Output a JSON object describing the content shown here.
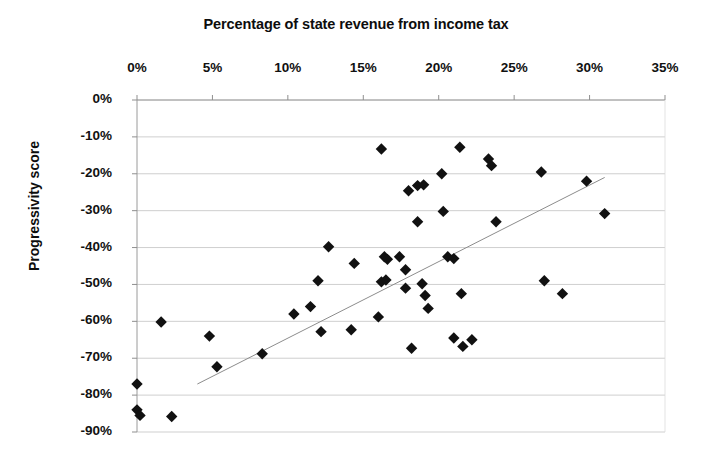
{
  "chart_data": {
    "type": "scatter",
    "title": "Percentage of state revenue from income tax",
    "xlabel": "Percentage of state revenue from income tax",
    "ylabel": "Progressivity score",
    "xlim": [
      0,
      35
    ],
    "ylim": [
      -90,
      0
    ],
    "grid": true,
    "legend": null,
    "x_axis_position": "top",
    "xticks": [
      "0%",
      "5%",
      "10%",
      "15%",
      "20%",
      "25%",
      "30%",
      "35%"
    ],
    "xtick_values": [
      0,
      5,
      10,
      15,
      20,
      25,
      30,
      35
    ],
    "yticks": [
      "0%",
      "-10%",
      "-20%",
      "-30%",
      "-40%",
      "-50%",
      "-60%",
      "-70%",
      "-80%",
      "-90%"
    ],
    "ytick_values": [
      0,
      -10,
      -20,
      -30,
      -40,
      -50,
      -60,
      -70,
      -80,
      -90
    ],
    "marker": "diamond",
    "marker_color": "#111111",
    "marker_size": 9,
    "trendline": {
      "x": [
        4.0,
        31.0
      ],
      "y": [
        -77.0,
        -21.0
      ],
      "color": "#8c8c8c",
      "width": 1
    },
    "points": [
      {
        "x": 0.0,
        "y": -77.0
      },
      {
        "x": 0.0,
        "y": -84.0
      },
      {
        "x": 0.2,
        "y": -85.5
      },
      {
        "x": 1.6,
        "y": -60.2
      },
      {
        "x": 2.3,
        "y": -85.8
      },
      {
        "x": 4.8,
        "y": -64.0
      },
      {
        "x": 5.3,
        "y": -72.3
      },
      {
        "x": 8.3,
        "y": -68.8
      },
      {
        "x": 10.4,
        "y": -58.0
      },
      {
        "x": 11.5,
        "y": -56.0
      },
      {
        "x": 12.0,
        "y": -49.0
      },
      {
        "x": 12.2,
        "y": -62.8
      },
      {
        "x": 12.7,
        "y": -39.8
      },
      {
        "x": 14.2,
        "y": -62.3
      },
      {
        "x": 14.4,
        "y": -44.3
      },
      {
        "x": 16.2,
        "y": -13.3
      },
      {
        "x": 16.4,
        "y": -42.5
      },
      {
        "x": 16.6,
        "y": -43.2
      },
      {
        "x": 16.2,
        "y": -49.3
      },
      {
        "x": 16.5,
        "y": -48.8
      },
      {
        "x": 16.0,
        "y": -58.8
      },
      {
        "x": 17.4,
        "y": -42.5
      },
      {
        "x": 17.8,
        "y": -46.0
      },
      {
        "x": 17.8,
        "y": -51.0
      },
      {
        "x": 18.0,
        "y": -24.6
      },
      {
        "x": 18.2,
        "y": -67.3
      },
      {
        "x": 18.6,
        "y": -23.2
      },
      {
        "x": 19.0,
        "y": -23.0
      },
      {
        "x": 18.6,
        "y": -33.0
      },
      {
        "x": 18.9,
        "y": -49.8
      },
      {
        "x": 19.1,
        "y": -53.0
      },
      {
        "x": 19.3,
        "y": -56.5
      },
      {
        "x": 20.2,
        "y": -20.0
      },
      {
        "x": 20.3,
        "y": -30.2
      },
      {
        "x": 20.6,
        "y": -42.5
      },
      {
        "x": 21.0,
        "y": -43.0
      },
      {
        "x": 21.0,
        "y": -64.5
      },
      {
        "x": 21.4,
        "y": -12.8
      },
      {
        "x": 21.5,
        "y": -52.5
      },
      {
        "x": 21.6,
        "y": -66.8
      },
      {
        "x": 22.2,
        "y": -65.0
      },
      {
        "x": 23.3,
        "y": -16.0
      },
      {
        "x": 23.5,
        "y": -17.8
      },
      {
        "x": 23.8,
        "y": -33.0
      },
      {
        "x": 26.8,
        "y": -19.5
      },
      {
        "x": 27.0,
        "y": -49.0
      },
      {
        "x": 28.2,
        "y": -52.5
      },
      {
        "x": 29.8,
        "y": -22.0
      },
      {
        "x": 31.0,
        "y": -30.8
      }
    ]
  }
}
